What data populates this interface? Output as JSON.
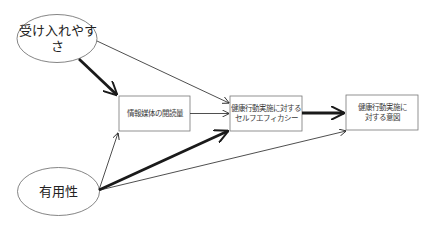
{
  "diagram": {
    "type": "path-model",
    "nodes": [
      {
        "id": "acceptability",
        "label": "受け入れやすさ",
        "shape": "ellipse"
      },
      {
        "id": "usefulness",
        "label": "有用性",
        "shape": "ellipse"
      },
      {
        "id": "media_reading",
        "label": "情報媒体の閲読量",
        "shape": "box"
      },
      {
        "id": "self_efficacy",
        "label": "健康行動実施に対する\nセルフエフィカシー",
        "shape": "box"
      },
      {
        "id": "intention",
        "label": "健康行動実施に\n対する意図",
        "shape": "box"
      }
    ],
    "edges": [
      {
        "from": "acceptability",
        "to": "media_reading",
        "weight": "thick"
      },
      {
        "from": "acceptability",
        "to": "self_efficacy",
        "weight": "thin"
      },
      {
        "from": "usefulness",
        "to": "media_reading",
        "weight": "thin"
      },
      {
        "from": "usefulness",
        "to": "self_efficacy",
        "weight": "thick"
      },
      {
        "from": "usefulness",
        "to": "intention",
        "weight": "thin"
      },
      {
        "from": "media_reading",
        "to": "self_efficacy",
        "weight": "thin"
      },
      {
        "from": "self_efficacy",
        "to": "intention",
        "weight": "thick"
      }
    ],
    "colors": {
      "line": "#222222",
      "box_border": "#777777",
      "ellipse_border": "#666666",
      "background": "#ffffff"
    }
  }
}
